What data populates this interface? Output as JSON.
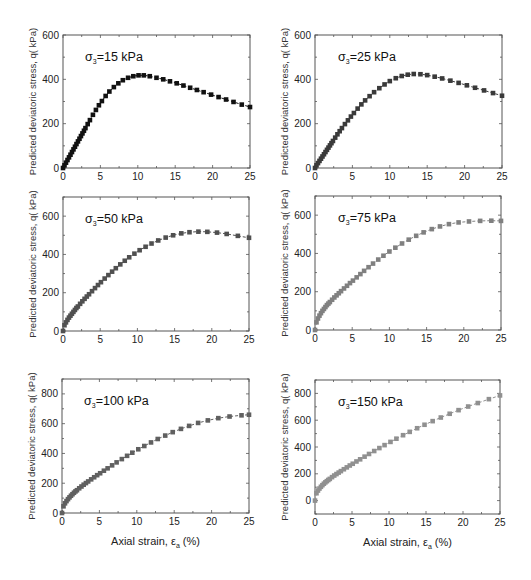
{
  "figure": {
    "ylabel": "Predicted deviatoric stress, q( kPa)",
    "xlabel_main": "Axial strain, ε",
    "xlabel_sub": "a",
    "xlabel_tail": " (%)"
  },
  "chart_data": [
    {
      "type": "scatter",
      "title": "σ3=15 kPa",
      "annotation": {
        "sigma": "σ",
        "sub": "3",
        "rest": "=15 kPa"
      },
      "xlabel": "",
      "ylabel": "Predicted deviatoric stress, q( kPa)",
      "xlim": [
        0,
        25
      ],
      "ylim": [
        0,
        600
      ],
      "xticks": [
        0,
        5,
        10,
        15,
        20,
        25
      ],
      "yticks": [
        0,
        200,
        400,
        600
      ],
      "color": "#111111",
      "x": [
        0,
        0.2,
        0.4,
        0.6,
        0.8,
        1.0,
        1.2,
        1.4,
        1.6,
        1.8,
        2.0,
        2.2,
        2.4,
        2.6,
        2.8,
        3.0,
        3.3,
        3.6,
        4.0,
        4.4,
        4.8,
        5.2,
        5.7,
        6.2,
        6.8,
        7.4,
        8.0,
        8.7,
        9.4,
        10.1,
        10.8,
        11.6,
        12.5,
        13.4,
        14.3,
        15.2,
        16.1,
        17.0,
        17.9,
        18.8,
        19.8,
        20.8,
        21.8,
        22.8,
        23.9,
        25.0
      ],
      "values": [
        0,
        12,
        24,
        36,
        48,
        60,
        72,
        84,
        96,
        108,
        120,
        132,
        144,
        156,
        168,
        180,
        198,
        216,
        240,
        262,
        283,
        302,
        325,
        345,
        365,
        382,
        396,
        407,
        414,
        418,
        418,
        414,
        407,
        400,
        391,
        382,
        372,
        362,
        352,
        342,
        331,
        320,
        309,
        298,
        286,
        275
      ]
    },
    {
      "type": "scatter",
      "title": "σ3=25 kPa",
      "annotation": {
        "sigma": "σ",
        "sub": "3",
        "rest": "=25 kPa"
      },
      "xlabel": "",
      "ylabel": "Predicted deviatoric stress, q( kPa)",
      "xlim": [
        0,
        25
      ],
      "ylim": [
        0,
        600
      ],
      "xticks": [
        0,
        5,
        10,
        15,
        20,
        25
      ],
      "yticks": [
        0,
        200,
        400,
        600
      ],
      "color": "#3a3a3a",
      "x": [
        0,
        0.2,
        0.4,
        0.6,
        0.8,
        1.0,
        1.2,
        1.4,
        1.6,
        1.8,
        2.0,
        2.2,
        2.4,
        2.7,
        3.0,
        3.3,
        3.6,
        4.0,
        4.4,
        4.8,
        5.2,
        5.7,
        6.2,
        6.7,
        7.3,
        7.9,
        8.6,
        9.3,
        10.0,
        10.8,
        11.6,
        12.4,
        13.2,
        14.1,
        15.0,
        16.0,
        17.0,
        18.1,
        19.2,
        20.3,
        21.4,
        22.6,
        23.8,
        25.0
      ],
      "values": [
        0,
        12,
        22,
        32,
        42,
        52,
        62,
        72,
        82,
        92,
        102,
        112,
        122,
        137,
        152,
        166,
        180,
        198,
        215,
        232,
        248,
        268,
        287,
        305,
        324,
        342,
        360,
        377,
        392,
        405,
        415,
        421,
        424,
        423,
        419,
        412,
        404,
        394,
        384,
        373,
        362,
        350,
        338,
        326
      ]
    },
    {
      "type": "scatter",
      "title": "σ3=50 kPa",
      "annotation": {
        "sigma": "σ",
        "sub": "3",
        "rest": "=50 kPa"
      },
      "xlabel": "",
      "ylabel": "Predicted deviatoric stress, q( kPa)",
      "xlim": [
        0,
        25
      ],
      "ylim": [
        0,
        700
      ],
      "xticks": [
        0,
        5,
        10,
        15,
        20,
        25
      ],
      "yticks": [
        0,
        200,
        400,
        600
      ],
      "color": "#505050",
      "x": [
        0,
        0.2,
        0.4,
        0.6,
        0.8,
        1.0,
        1.2,
        1.4,
        1.6,
        1.8,
        2.0,
        2.3,
        2.6,
        2.9,
        3.2,
        3.5,
        3.9,
        4.3,
        4.7,
        5.1,
        5.6,
        6.1,
        6.6,
        7.1,
        7.7,
        8.3,
        8.9,
        9.6,
        10.3,
        11.1,
        11.9,
        12.8,
        13.8,
        14.8,
        15.9,
        17.0,
        18.2,
        19.4,
        20.7,
        22.0,
        23.5,
        25.0
      ],
      "values": [
        0,
        30,
        45,
        58,
        70,
        80,
        90,
        100,
        110,
        120,
        128,
        142,
        155,
        168,
        180,
        192,
        208,
        224,
        240,
        255,
        274,
        292,
        310,
        328,
        348,
        367,
        385,
        404,
        422,
        440,
        457,
        473,
        488,
        500,
        510,
        516,
        519,
        518,
        514,
        507,
        497,
        487
      ]
    },
    {
      "type": "scatter",
      "title": "σ3=75 kPa",
      "annotation": {
        "sigma": "σ",
        "sub": "3",
        "rest": "=75 kPa"
      },
      "xlabel": "",
      "ylabel": "Predicted deviatoric stress, q( kPa)",
      "xlim": [
        0,
        25
      ],
      "ylim": [
        0,
        700
      ],
      "xticks": [
        0,
        5,
        10,
        15,
        20,
        25
      ],
      "yticks": [
        0,
        200,
        400,
        600
      ],
      "color": "#808080",
      "x": [
        0,
        0.2,
        0.4,
        0.6,
        0.8,
        1.0,
        1.2,
        1.4,
        1.6,
        1.8,
        2.0,
        2.3,
        2.6,
        2.9,
        3.2,
        3.5,
        3.9,
        4.3,
        4.7,
        5.1,
        5.6,
        6.1,
        6.6,
        7.2,
        7.8,
        8.5,
        9.2,
        10.0,
        10.8,
        11.7,
        12.6,
        13.6,
        14.6,
        15.7,
        16.8,
        18.0,
        19.3,
        20.7,
        22.2,
        23.7,
        25.0
      ],
      "values": [
        0,
        40,
        60,
        75,
        88,
        100,
        110,
        120,
        130,
        138,
        146,
        158,
        170,
        181,
        192,
        203,
        217,
        231,
        245,
        258,
        275,
        292,
        309,
        328,
        347,
        368,
        388,
        410,
        430,
        452,
        472,
        492,
        510,
        527,
        541,
        553,
        562,
        567,
        570,
        571,
        570
      ]
    },
    {
      "type": "scatter",
      "title": "σ3=100 kPa",
      "annotation": {
        "sigma": "σ",
        "sub": "3",
        "rest": "=100 kPa"
      },
      "xlabel": "Axial strain, εa (%)",
      "ylabel": "Predicted deviatoric stress, q( kPa)",
      "xlim": [
        0,
        25
      ],
      "ylim": [
        0,
        900
      ],
      "xticks": [
        0,
        5,
        10,
        15,
        20,
        25
      ],
      "yticks": [
        0,
        200,
        400,
        600,
        800
      ],
      "color": "#606060",
      "x": [
        0,
        0.2,
        0.4,
        0.6,
        0.8,
        1.0,
        1.2,
        1.4,
        1.6,
        1.8,
        2.0,
        2.3,
        2.6,
        2.9,
        3.2,
        3.5,
        3.9,
        4.3,
        4.7,
        5.1,
        5.6,
        6.1,
        6.7,
        7.3,
        8.0,
        8.7,
        9.4,
        10.2,
        11.0,
        11.9,
        12.8,
        13.8,
        14.8,
        15.9,
        17.0,
        18.2,
        19.5,
        20.9,
        22.4,
        24.0,
        25.0
      ],
      "values": [
        0,
        45,
        65,
        80,
        93,
        105,
        116,
        126,
        136,
        145,
        153,
        166,
        178,
        190,
        201,
        212,
        226,
        240,
        254,
        267,
        284,
        300,
        320,
        340,
        362,
        384,
        405,
        428,
        450,
        474,
        497,
        520,
        543,
        565,
        585,
        605,
        622,
        637,
        648,
        656,
        660
      ]
    },
    {
      "type": "scatter",
      "title": "σ3=150 kPa",
      "annotation": {
        "sigma": "σ",
        "sub": "3",
        "rest": "=150 kPa"
      },
      "xlabel": "Axial strain, εa (%)",
      "ylabel": "Predicted deviatoric stress, q( kPa)",
      "xlim": [
        0,
        25
      ],
      "ylim": [
        -100,
        900
      ],
      "xticks": [
        0,
        5,
        10,
        15,
        20,
        25
      ],
      "yticks": [
        0,
        200,
        400,
        600,
        800
      ],
      "color": "#909090",
      "x": [
        0,
        0.2,
        0.4,
        0.6,
        0.8,
        1.0,
        1.2,
        1.4,
        1.6,
        1.8,
        2.0,
        2.3,
        2.6,
        2.9,
        3.2,
        3.5,
        3.9,
        4.3,
        4.7,
        5.1,
        5.6,
        6.1,
        6.7,
        7.3,
        8.0,
        8.7,
        9.4,
        10.2,
        11.0,
        11.9,
        12.8,
        13.8,
        14.8,
        15.9,
        17.0,
        18.2,
        19.4,
        20.7,
        22.0,
        23.5,
        25.0
      ],
      "values": [
        0,
        55,
        75,
        90,
        103,
        115,
        126,
        136,
        145,
        154,
        162,
        175,
        187,
        198,
        209,
        220,
        234,
        248,
        262,
        275,
        292,
        308,
        328,
        348,
        370,
        392,
        414,
        438,
        462,
        488,
        513,
        540,
        566,
        593,
        620,
        648,
        675,
        702,
        728,
        757,
        785
      ]
    }
  ]
}
